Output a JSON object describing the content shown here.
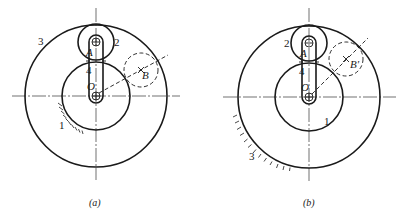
{
  "figures": [
    {
      "id": "a",
      "caption": "(a)",
      "labels": {
        "outer_gear": "3",
        "planet_gear": "2",
        "sun_gear": "1",
        "arm": "4",
        "point_a": "A",
        "point_o": "O",
        "point_b": "B"
      },
      "fixed_member": "1"
    },
    {
      "id": "b",
      "caption": "(b)",
      "labels": {
        "outer_gear": "3",
        "planet_gear": "2",
        "sun_gear": "1",
        "arm": "4",
        "point_a": "A",
        "point_o": "O",
        "point_b": "B'"
      },
      "fixed_member": "3"
    }
  ],
  "colors": {
    "ink": "#1a1a1a",
    "background": "#ffffff"
  }
}
